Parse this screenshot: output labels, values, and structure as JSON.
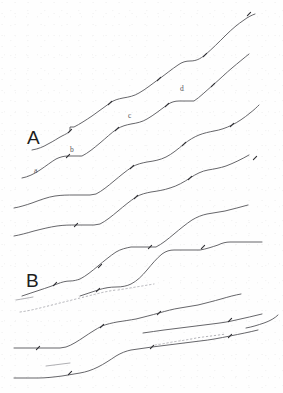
{
  "figure": {
    "background_color": "#fefefe",
    "line_color": "#4a4a4f",
    "faint_line_color": "#9a9aa0",
    "dotted_line_color": "#a8a8ae",
    "panel_labels": [
      {
        "id": "panel-a",
        "text": "A",
        "x": 27,
        "y": 128
      },
      {
        "id": "panel-b",
        "text": "B",
        "x": 26,
        "y": 271
      }
    ],
    "segment_labels": [
      {
        "id": "seg-a",
        "text": "a",
        "x": 34,
        "y": 167
      },
      {
        "id": "seg-b",
        "text": "b",
        "x": 70,
        "y": 146
      },
      {
        "id": "seg-c",
        "text": "c",
        "x": 128,
        "y": 112
      },
      {
        "id": "seg-d",
        "text": "d",
        "x": 180,
        "y": 85
      }
    ],
    "traces": [
      {
        "id": "trace-1",
        "style": "solid",
        "d": "M 32,150 C 38,149 43,147 48,144 C 54,141 58,138 62,136 C 66,134 68,133 70,131 L 70,127 L 74,127 C 80,124 86,120 92,116 C 98,112 104,107 110,103 C 114,100 118,99 123,98 C 129,97 134,96 139,93 C 146,89 152,84 159,79 C 166,74 172,69 178,65 C 182,62 186,61 190,61 C 196,61 200,59 205,55 C 212,49 219,42 226,35 C 232,29 238,24 244,20 C 248,17 252,15 255,14"
      },
      {
        "id": "trace-2",
        "style": "solid",
        "d": "M 22,178 C 28,177 34,174 40,170 C 46,166 51,162 56,159 C 60,157 64,156 68,156 L 78,156 L 82,156 C 88,153 94,148 100,143 C 106,138 111,133 117,129 C 122,126 126,125 131,124 C 137,123 142,122 147,119 C 154,115 160,110 167,105 C 171,102 175,101 179,101 L 190,101 L 194,101 C 200,97 206,91 213,85 C 220,79 226,73 232,68 C 238,63 244,58 249,54"
      },
      {
        "id": "trace-3",
        "style": "solid",
        "d": "M 14,208 C 20,207 26,205 32,203 C 40,200 48,197 55,196 C 62,195 68,195 74,195 L 90,195 L 96,194 C 102,191 108,186 114,181 C 120,176 126,171 132,167 C 137,164 142,163 147,162 C 154,161 160,160 166,157 C 172,154 178,149 184,144 C 189,140 194,137 199,135 C 204,133 209,132 214,131 C 220,130 226,128 232,125 C 238,122 244,118 250,113 C 254,110 257,107 259,105"
      },
      {
        "id": "trace-4",
        "style": "solid",
        "d": "M 14,236 C 20,235 27,233 34,231 C 42,229 50,227 57,226 C 64,225 70,225 76,225 L 94,225 L 100,224 C 106,221 112,216 118,211 C 124,206 130,201 136,197 C 141,194 146,193 151,192 C 158,191 164,190 170,188 C 177,186 184,182 190,178 C 196,174 202,171 208,170 C 214,169 220,168 226,166 C 234,163 242,159 249,155"
      },
      {
        "id": "trace-5",
        "style": "solid",
        "d": "M 22,296 C 28,294 34,292 40,290 C 46,288 52,286 57,284 C 62,282 66,281 70,281 C 74,281 77,280 80,279 C 86,276 92,271 98,266 C 104,261 110,256 116,252 C 121,249 126,248 131,247 L 150,247 L 156,247 C 162,244 168,239 174,234 C 180,229 186,224 192,220 C 197,217 202,215 207,214 C 213,213 219,212 225,211 C 233,209 241,207 248,205"
      },
      {
        "id": "trace-6",
        "style": "solid",
        "d": "M 80,296 C 86,294 92,292 98,290 C 104,288 110,287 116,287 C 122,287 127,286 131,284 C 137,281 142,276 147,270 C 152,264 157,258 162,254 C 166,251 170,250 174,250 L 195,250 L 200,250 C 206,249 212,247 218,245 C 222,243 226,242 230,242 L 252,242 L 262,242"
      },
      {
        "id": "trace-7",
        "style": "solid",
        "d": "M 14,348 C 22,348 30,348 38,348 L 60,348 L 66,347 C 72,345 78,341 84,337 C 90,333 96,329 102,326 C 107,324 112,323 117,322 C 124,321 130,320 136,319 C 144,317 152,315 159,313 C 166,311 173,309 180,308 C 186,307 192,306 198,305 C 206,303 214,301 221,299 C 228,297 235,295 241,294"
      },
      {
        "id": "trace-8",
        "style": "solid",
        "d": "M 14,378 C 22,378 30,378 38,378 C 46,378 54,377 62,376 C 68,375 74,374 80,373 C 86,372 92,370 98,367 C 104,364 110,360 116,356 C 121,353 126,351 131,350 C 138,349 145,348 152,347 C 160,346 168,345 176,344 C 184,343 192,342 200,341 C 210,340 220,338 230,336 C 240,334 250,332 258,330"
      },
      {
        "id": "trace-9",
        "style": "solid",
        "d": "M 143,333 C 150,332 157,331 164,330 C 172,329 180,328 188,327 C 196,326 204,325 212,324 C 220,323 228,322 236,320 C 245,318 254,316 262,314"
      },
      {
        "id": "trace-10",
        "style": "dotted",
        "d": "M 20,312 C 28,311 36,309 44,307 C 52,305 60,303 68,301 C 76,299 84,297 92,295 C 100,293 108,291 116,290"
      },
      {
        "id": "trace-11",
        "style": "dotted",
        "d": "M 118,290 C 124,289 130,288 136,287 C 142,286 148,285 154,284"
      },
      {
        "id": "trace-12",
        "style": "dotted",
        "d": "M 155,345 C 163,344 171,342 179,341 C 187,340 195,338 203,337 C 211,336 219,335 226,334"
      },
      {
        "id": "trace-13",
        "style": "faint",
        "d": "M 16,300 C 22,299 28,298 33,297"
      },
      {
        "id": "trace-14",
        "style": "faint",
        "d": "M 46,366 C 54,365 62,364 70,363"
      },
      {
        "id": "trace-15",
        "style": "solid",
        "d": "M 246,328 C 252,327 258,325 264,323 C 270,321 275,318 278,315"
      }
    ],
    "tick_marks": [
      {
        "id": "tick-1",
        "x": 110,
        "y": 103
      },
      {
        "id": "tick-2",
        "x": 159,
        "y": 79
      },
      {
        "id": "tick-3",
        "x": 205,
        "y": 55
      },
      {
        "id": "tick-4",
        "x": 249,
        "y": 14
      },
      {
        "id": "tick-5",
        "x": 70,
        "y": 131
      },
      {
        "id": "tick-6",
        "x": 117,
        "y": 129
      },
      {
        "id": "tick-7",
        "x": 167,
        "y": 105
      },
      {
        "id": "tick-8",
        "x": 213,
        "y": 85
      },
      {
        "id": "tick-9",
        "x": 68,
        "y": 156
      },
      {
        "id": "tick-10",
        "x": 132,
        "y": 167
      },
      {
        "id": "tick-11",
        "x": 184,
        "y": 144
      },
      {
        "id": "tick-12",
        "x": 232,
        "y": 125
      },
      {
        "id": "tick-13",
        "x": 255,
        "y": 158
      },
      {
        "id": "tick-14",
        "x": 76,
        "y": 225
      },
      {
        "id": "tick-15",
        "x": 136,
        "y": 197
      },
      {
        "id": "tick-16",
        "x": 190,
        "y": 178
      },
      {
        "id": "tick-17",
        "x": 55,
        "y": 284
      },
      {
        "id": "tick-18",
        "x": 100,
        "y": 266
      },
      {
        "id": "tick-19",
        "x": 150,
        "y": 247
      },
      {
        "id": "tick-20",
        "x": 203,
        "y": 247
      },
      {
        "id": "tick-21",
        "x": 98,
        "y": 290
      },
      {
        "id": "tick-22",
        "x": 38,
        "y": 348
      },
      {
        "id": "tick-23",
        "x": 102,
        "y": 326
      },
      {
        "id": "tick-24",
        "x": 159,
        "y": 313
      },
      {
        "id": "tick-25",
        "x": 230,
        "y": 336
      },
      {
        "id": "tick-26",
        "x": 70,
        "y": 373
      },
      {
        "id": "tick-27",
        "x": 152,
        "y": 347
      },
      {
        "id": "tick-28",
        "x": 230,
        "y": 320
      }
    ]
  }
}
